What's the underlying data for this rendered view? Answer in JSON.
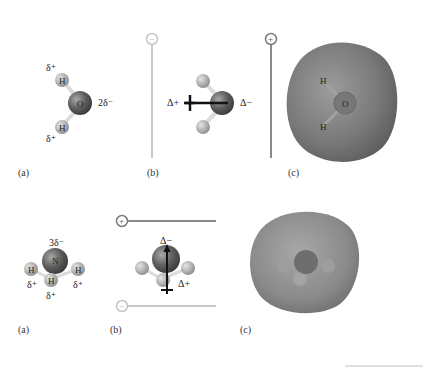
{
  "water": {
    "panel_a": {
      "label": "(a)",
      "atoms": {
        "oxygen": "O",
        "hydrogen_top": "H",
        "hydrogen_bottom": "H"
      },
      "charges": {
        "oxygen": "2δ⁻",
        "hydrogen_top": "δ⁺",
        "hydrogen_bottom": "δ⁺"
      }
    },
    "panel_b": {
      "label": "(b)",
      "plate_left_sign": "−",
      "plate_right_sign": "+",
      "dipole_positive": "Δ+",
      "dipole_negative": "Δ−"
    },
    "panel_c": {
      "label": "(c)",
      "atoms": {
        "oxygen": "O",
        "hydrogen_top": "H",
        "hydrogen_bottom": "H"
      }
    }
  },
  "ammonia": {
    "panel_a": {
      "label": "(a)",
      "atoms": {
        "nitrogen": "N",
        "hydrogen_left": "H",
        "hydrogen_front": "H",
        "hydrogen_right": "H"
      },
      "charges": {
        "nitrogen": "3δ⁻",
        "hydrogen_left": "δ⁺",
        "hydrogen_front": "δ⁺",
        "hydrogen_right": "δ⁺"
      }
    },
    "panel_b": {
      "label": "(b)",
      "plate_top_sign": "+",
      "plate_bottom_sign": "−",
      "dipole_negative": "Δ−",
      "dipole_positive": "Δ+"
    },
    "panel_c": {
      "label": "(c)"
    }
  },
  "colors": {
    "central_atom": "#6e6e6e",
    "hydrogen": "#b4b4b4",
    "positive_plate": "#8a8a8a",
    "negative_plate": "#c8c8c8",
    "density_surface": "#7d7d7d"
  }
}
